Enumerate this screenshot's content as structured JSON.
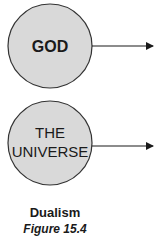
{
  "diagram": {
    "nodes": [
      {
        "id": "god",
        "label_lines": [
          "GOD"
        ],
        "fill": "#d9d9d9",
        "stroke": "#333333"
      },
      {
        "id": "universe",
        "label_lines": [
          "THE",
          "UNIVERSE"
        ],
        "fill": "#d9d9d9",
        "stroke": "#333333"
      }
    ],
    "edges": [
      {
        "from": "god",
        "direction": "right"
      },
      {
        "from": "universe",
        "direction": "right"
      }
    ]
  },
  "caption": {
    "title": "Dualism",
    "figure": "Figure 15.4"
  }
}
